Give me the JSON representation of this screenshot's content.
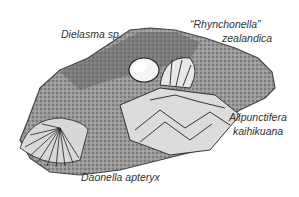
{
  "figure": {
    "labels": {
      "dielasma": "Dielasma sp.",
      "rhynchonella_line1": "“Rhynchonella”",
      "rhynchonella_line2": "zealandica",
      "alipunctifera_line1": "Alipunctifera",
      "alipunctifera_line2": "kaihikuana",
      "daonella": "Daonella apteryx"
    },
    "colors": {
      "rock_dark": "#4a4a4a",
      "rock_mid": "#8a8a8a",
      "rock_light": "#c8c8c8",
      "shell_outline": "#222222",
      "background": "#ffffff"
    }
  }
}
